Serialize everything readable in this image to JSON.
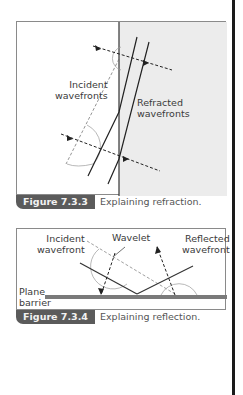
{
  "figures": [
    {
      "number": "Figure 7.3.3",
      "caption": "Explaining refraction.",
      "labels": {
        "incident": [
          "Incident",
          "wavefronts"
        ],
        "refracted": [
          "Refracted",
          "wavefronts"
        ]
      }
    },
    {
      "number": "Figure 7.3.4",
      "caption": "Explaining reflection.",
      "labels": {
        "incident": [
          "Incident",
          "wavefront"
        ],
        "wavelet": "Wavelet",
        "reflected": [
          "Reflected",
          "wavefront"
        ],
        "barrier": [
          "Plane",
          "barrier"
        ]
      }
    }
  ],
  "colors": {
    "caption_tab": "#5b5b5b",
    "shaded_medium": "#ececec",
    "barrier": "#7a7a7a",
    "side_rule": "#1a1a1a"
  }
}
